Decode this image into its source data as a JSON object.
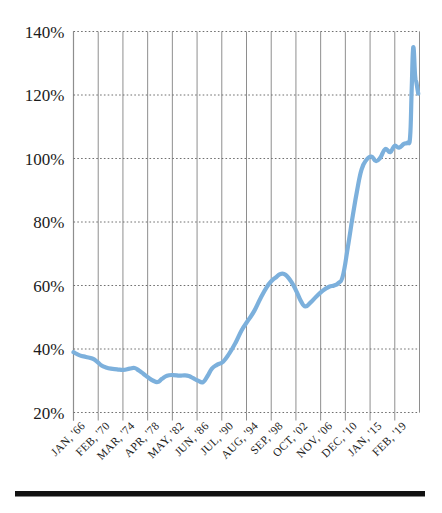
{
  "figure": {
    "background": "#ffffff",
    "bottom_rule_color": "#111111"
  },
  "chart_data": {
    "type": "line",
    "title": "",
    "subtitle": "",
    "xlabel": "",
    "ylabel": "",
    "grid": "both-axes-dotted-horizontal-solid-vertical",
    "legend": "none",
    "line_color": "#7CB0DC",
    "line_width": 4.2,
    "ylim": [
      20,
      140
    ],
    "yticks": [
      20,
      40,
      60,
      80,
      100,
      120,
      140
    ],
    "ytick_labels": [
      "20%",
      "40%",
      "60%",
      "80%",
      "100%",
      "120%",
      "140%"
    ],
    "xtick_labels": [
      "JAN, '66",
      "FEB, '70",
      "MAR, '74",
      "APR, '78",
      "MAY, '82",
      "JUN, '86",
      "JUL, '90",
      "AUG, '94",
      "SEP, '98",
      "OCT, '02",
      "NOV, '06",
      "DEC, '10",
      "JAN, '15",
      "FEB, '19"
    ],
    "xtick_rotation_degrees": -45,
    "x_axis_note": "Each gridline marks roughly a 4-year step from JAN 1966 through FEB 2019; series continues past the final label to 2021.",
    "xlim": [
      1966,
      2021.5
    ],
    "series": [
      {
        "name": "ratio",
        "units": "percent",
        "x": [
          1966.0,
          1967.0,
          1968.0,
          1969.0,
          1969.8,
          1970.5,
          1971.2,
          1972.0,
          1973.0,
          1974.0,
          1975.0,
          1975.8,
          1976.5,
          1977.2,
          1978.0,
          1978.8,
          1979.5,
          1980.2,
          1981.0,
          1982.0,
          1983.0,
          1983.8,
          1984.5,
          1985.2,
          1986.0,
          1986.8,
          1987.5,
          1988.2,
          1989.0,
          1990.0,
          1991.0,
          1992.0,
          1993.0,
          1994.0,
          1995.0,
          1996.0,
          1997.0,
          1997.8,
          1998.5,
          1999.2,
          2000.0,
          2001.0,
          2001.8,
          2002.5,
          2003.2,
          2004.0,
          2005.0,
          2006.0,
          2007.0,
          2007.8,
          2008.5,
          2009.2,
          2010.0,
          2010.8,
          2011.5,
          2012.2,
          2013.0,
          2013.8,
          2014.5,
          2015.2,
          2016.0,
          2016.8,
          2017.5,
          2018.2,
          2019.0,
          2019.6,
          2020.0,
          2020.25,
          2020.5,
          2020.8,
          2021.0,
          2021.3
        ],
        "y": [
          39.0,
          38.0,
          37.5,
          37.0,
          36.0,
          34.8,
          34.2,
          33.8,
          33.6,
          33.4,
          33.8,
          34.0,
          33.2,
          32.2,
          31.0,
          30.0,
          29.6,
          30.6,
          31.6,
          31.8,
          31.6,
          31.7,
          31.5,
          30.8,
          30.0,
          29.6,
          31.5,
          33.8,
          35.0,
          36.0,
          38.6,
          42.0,
          46.0,
          49.0,
          52.0,
          56.0,
          59.5,
          61.5,
          62.6,
          63.6,
          63.4,
          61.0,
          58.0,
          55.0,
          53.4,
          54.6,
          56.6,
          58.4,
          59.6,
          60.0,
          60.8,
          63.0,
          72.0,
          82.0,
          90.0,
          96.5,
          99.6,
          100.6,
          99.2,
          100.2,
          103.0,
          102.0,
          104.0,
          103.4,
          104.6,
          105.0,
          107.0,
          122.0,
          135.0,
          126.0,
          124.0,
          120.4
        ]
      }
    ],
    "annotations": []
  }
}
